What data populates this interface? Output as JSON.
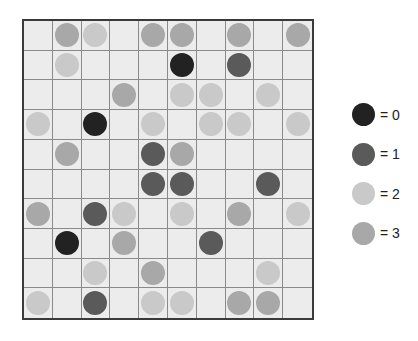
{
  "colors": {
    "0": "#222222",
    "1": "#5a5a5a",
    "2": "#c9c9c9",
    "3": "#a8a8a8"
  },
  "grid": {
    "rows": 10,
    "cols": 10,
    "cells": [
      [
        null,
        3,
        2,
        null,
        3,
        3,
        null,
        3,
        null,
        3
      ],
      [
        null,
        2,
        null,
        null,
        null,
        0,
        null,
        1,
        null,
        null
      ],
      [
        null,
        null,
        null,
        3,
        null,
        2,
        2,
        null,
        2,
        null
      ],
      [
        2,
        null,
        0,
        null,
        2,
        null,
        2,
        2,
        null,
        2
      ],
      [
        null,
        3,
        null,
        null,
        1,
        3,
        null,
        null,
        null,
        null
      ],
      [
        null,
        null,
        null,
        null,
        1,
        1,
        null,
        null,
        1,
        null
      ],
      [
        3,
        null,
        1,
        2,
        null,
        2,
        null,
        3,
        null,
        2
      ],
      [
        null,
        0,
        null,
        3,
        null,
        null,
        1,
        null,
        null,
        null
      ],
      [
        null,
        null,
        2,
        null,
        3,
        null,
        null,
        null,
        2,
        null
      ],
      [
        2,
        null,
        1,
        null,
        2,
        2,
        null,
        3,
        3,
        null
      ]
    ]
  },
  "legend": {
    "items": [
      {
        "value": 0,
        "label": "= 0"
      },
      {
        "value": 1,
        "label": "= 1"
      },
      {
        "value": 2,
        "label": "= 2"
      },
      {
        "value": 3,
        "label": "= 3"
      }
    ]
  }
}
